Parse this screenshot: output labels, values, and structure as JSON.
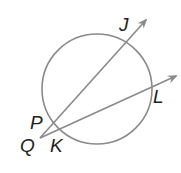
{
  "diagram": {
    "circle": {
      "cx": 97,
      "cy": 89,
      "r": 55,
      "stroke": "#8a8a8a"
    },
    "rays": [
      {
        "name": "QJ",
        "from": [
          40,
          138
        ],
        "to": [
          146,
          20
        ]
      },
      {
        "name": "QL",
        "from": [
          40,
          138
        ],
        "to": [
          176,
          76
        ]
      }
    ],
    "labels": {
      "J": "J",
      "L": "L",
      "P": "P",
      "Q": "Q",
      "K": "K"
    },
    "stroke_color": "#8a8a8a",
    "label_color": "#222222"
  }
}
